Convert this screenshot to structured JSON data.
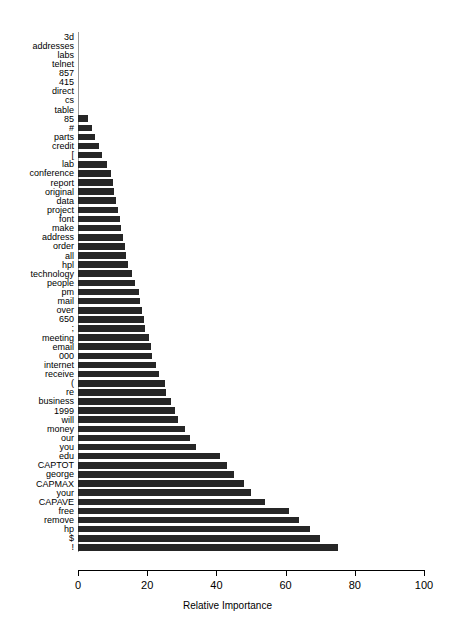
{
  "chart_data": {
    "type": "bar",
    "orientation": "horizontal",
    "title": "",
    "subtitle": "",
    "xlabel": "Relative Importance",
    "ylabel": "",
    "xlim": [
      0,
      100
    ],
    "xticks": [
      0,
      20,
      40,
      60,
      80,
      100
    ],
    "xtick_labels": [
      "0",
      "20",
      "40",
      "60",
      "80",
      "100"
    ],
    "grid": false,
    "legend": null,
    "bar_color": "#262626",
    "axis_color": "#000000",
    "baseline_color": "#9a9a9a",
    "categories": [
      "3d",
      "addresses",
      "labs",
      "telnet",
      "857",
      "415",
      "direct",
      "cs",
      "table",
      "85",
      "#",
      "parts",
      "credit",
      "[",
      "lab",
      "conference",
      "report",
      "original",
      "data",
      "project",
      "font",
      "make",
      "address",
      "order",
      "all",
      "hpl",
      "technology",
      "people",
      "pm",
      "mail",
      "over",
      "650",
      ";",
      "meeting",
      "email",
      "000",
      "internet",
      "receive",
      "(",
      "re",
      "business",
      "1999",
      "will",
      "money",
      "our",
      "you",
      "edu",
      "CAPTOT",
      "george",
      "CAPMAX",
      "your",
      "CAPAVE",
      "free",
      "remove",
      "hp",
      "$",
      "!"
    ],
    "values": [
      0,
      0,
      0,
      0,
      0,
      0,
      0,
      0,
      0,
      3,
      4,
      5,
      6,
      7,
      8.5,
      9.5,
      10,
      10.5,
      11,
      11.5,
      12,
      12.5,
      13,
      13.5,
      14,
      14.5,
      15.5,
      16.5,
      17.5,
      18,
      18.5,
      19,
      19.5,
      20.5,
      21,
      21.5,
      22.5,
      23.5,
      25,
      25.5,
      27,
      28,
      29,
      31,
      32.5,
      34,
      41,
      43,
      45,
      48,
      50,
      54,
      61,
      64,
      67,
      70,
      75
    ]
  }
}
